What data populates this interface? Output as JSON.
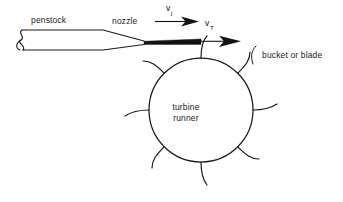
{
  "figure": {
    "type": "technical-diagram",
    "background_color": "#ffffff",
    "ink_color": "#1a1a1a",
    "jet_color": "#111111",
    "width": 343,
    "height": 202
  },
  "labels": {
    "penstock": "penstock",
    "nozzle": "nozzle",
    "bucket_or_blade": "bucket or blade",
    "turbine_line1": "turbine",
    "turbine_line2": "runner"
  },
  "velocities": {
    "jet": {
      "symbol": "v",
      "subscript": "j"
    },
    "tangential": {
      "symbol": "v",
      "subscript": "T"
    }
  },
  "geometry": {
    "runner_center_x": 201,
    "runner_center_y": 110,
    "runner_radius": 52,
    "bucket_count": 8
  }
}
